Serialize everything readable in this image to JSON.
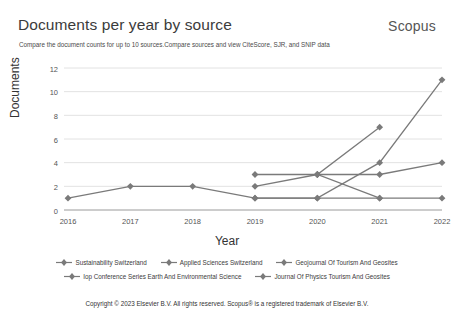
{
  "header": {
    "title": "Documents per year by source",
    "brand": "Scopus",
    "subtitle": "Compare the document counts for up to 10 sources.Compare sources and view CiteScore, SJR, and SNIP data"
  },
  "footer": {
    "text": "Copyright © 2023 Elsevier B.V. All rights reserved. Scopus® is a registered trademark of Elsevier B.V."
  },
  "chart_data": {
    "type": "line",
    "title": "Documents per year by source",
    "xlabel": "Year",
    "ylabel": "Documents",
    "categories": [
      "2016",
      "2017",
      "2018",
      "2019",
      "2020",
      "2021",
      "2022"
    ],
    "x": [
      2016,
      2017,
      2018,
      2019,
      2020,
      2021,
      2022
    ],
    "ylim": [
      0,
      12
    ],
    "yticks": [
      0,
      2,
      4,
      6,
      8,
      10,
      12
    ],
    "grid": true,
    "legend_position": "bottom",
    "line_color": "#7a7a7a",
    "marker": "diamond",
    "series": [
      {
        "name": "Sustainability Switzerland",
        "values": [
          1,
          2,
          2,
          1,
          1,
          4,
          11
        ]
      },
      {
        "name": "Applied Sciences Switzerland",
        "values": [
          null,
          null,
          null,
          null,
          3,
          3,
          4
        ]
      },
      {
        "name": "Geojournal Of Tourism And Geosites",
        "values": [
          null,
          null,
          null,
          3,
          3,
          7,
          null
        ]
      },
      {
        "name": "Iop Conference Series Earth And Environmental Science",
        "values": [
          null,
          null,
          null,
          2,
          3,
          1,
          null
        ]
      },
      {
        "name": "Journal Of Physics Tourism And Geosites",
        "values": [
          null,
          null,
          null,
          1,
          1,
          1,
          1
        ]
      }
    ]
  },
  "legend": {
    "row1": [
      {
        "label": "Sustainability Switzerland"
      },
      {
        "label": "Applied Sciences Switzerland"
      },
      {
        "label": "Geojournal Of Tourism And Geosites"
      }
    ],
    "row2": [
      {
        "label": "Iop Conference Series Earth And Environmental Science"
      },
      {
        "label": "Journal Of Physics Tourism And Geosites"
      }
    ]
  }
}
